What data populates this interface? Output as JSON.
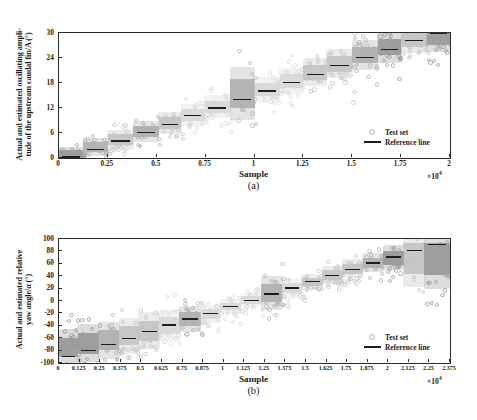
{
  "figure": {
    "panels": [
      {
        "tag": "(a)",
        "xlabel": "Sample",
        "ylabel": "Actual and estimated oscillating ampli-\ntude of the upstream caudal fin/A (°)",
        "x_exponent": "×10",
        "x_exponent_sup": "4",
        "legend": [
          {
            "label": "Test set",
            "marker": "circle"
          },
          {
            "label": "Reference line",
            "marker": "line"
          }
        ]
      },
      {
        "tag": "(b)",
        "xlabel": "Sample",
        "ylabel": "Actual and estimated relative\nyaw angle/α (°)",
        "x_exponent": "×10",
        "x_exponent_sup": "4",
        "legend": [
          {
            "label": "Test set",
            "marker": "circle"
          },
          {
            "label": "Reference line",
            "marker": "line"
          }
        ]
      }
    ]
  },
  "chart_data": [
    {
      "type": "scatter",
      "title": "",
      "subtitle": "(a)",
      "xlabel": "Sample",
      "ylabel": "Actual and estimated oscillating amplitude of the upstream caudal fin/A (°)",
      "x_tick_labels": [
        "0",
        "0.25",
        "0.5",
        "0.75",
        "1",
        "1.25",
        "1.5",
        "1.75",
        "2"
      ],
      "x_tick_values": [
        0,
        2500,
        5000,
        7500,
        10000,
        12500,
        15000,
        17500,
        20000
      ],
      "x_axis_multiplier": "×10^4",
      "y_tick_labels": [
        "0",
        "6",
        "12",
        "18",
        "24",
        "30"
      ],
      "y_tick_values": [
        0,
        6,
        12,
        18,
        24,
        30
      ],
      "xlim": [
        0,
        20000
      ],
      "ylim": [
        0,
        30
      ],
      "grid": false,
      "legend": [
        "Test set",
        "Reference line"
      ],
      "legend_position": "lower-right",
      "series": [
        {
          "name": "Reference line",
          "type": "step",
          "note": "piecewise constant actual value per sample block",
          "segments": [
            {
              "x_start": 0,
              "x_end": 1250,
              "value": 0.2
            },
            {
              "x_start": 1250,
              "x_end": 2500,
              "value": 2.1
            },
            {
              "x_start": 2500,
              "x_end": 3800,
              "value": 4.1
            },
            {
              "x_start": 3800,
              "x_end": 5100,
              "value": 6.1
            },
            {
              "x_start": 5100,
              "x_end": 6250,
              "value": 8.1
            },
            {
              "x_start": 6250,
              "x_end": 7450,
              "value": 10.2
            },
            {
              "x_start": 7450,
              "x_end": 8750,
              "value": 12.0
            },
            {
              "x_start": 8750,
              "x_end": 10000,
              "value": 14.0
            },
            {
              "x_start": 10000,
              "x_end": 11300,
              "value": 16.1
            },
            {
              "x_start": 11300,
              "x_end": 12500,
              "value": 18.1
            },
            {
              "x_start": 12500,
              "x_end": 13700,
              "value": 20.1
            },
            {
              "x_start": 13700,
              "x_end": 15000,
              "value": 22.2
            },
            {
              "x_start": 15000,
              "x_end": 16300,
              "value": 24.1
            },
            {
              "x_start": 16300,
              "x_end": 17500,
              "value": 26.1
            },
            {
              "x_start": 17500,
              "x_end": 18800,
              "value": 28.2
            },
            {
              "x_start": 18800,
              "x_end": 20000,
              "value": 30.0
            }
          ]
        },
        {
          "name": "Test set",
          "type": "scatter-cloud",
          "note": "estimated values scattered about each reference level",
          "clouds": [
            {
              "x_start": 0,
              "x_end": 1250,
              "center": 0.9,
              "spread": 1.6,
              "shade": "dark"
            },
            {
              "x_start": 1250,
              "x_end": 2500,
              "center": 2.6,
              "spread": 1.9,
              "shade": "mid"
            },
            {
              "x_start": 2500,
              "x_end": 3800,
              "center": 4.4,
              "spread": 2.1,
              "shade": "light"
            },
            {
              "x_start": 3800,
              "x_end": 5100,
              "center": 6.4,
              "spread": 2.2,
              "shade": "mid"
            },
            {
              "x_start": 5100,
              "x_end": 6250,
              "center": 8.4,
              "spread": 2.3,
              "shade": "light"
            },
            {
              "x_start": 6250,
              "x_end": 7450,
              "center": 10.4,
              "spread": 2.3,
              "shade": "verylight"
            },
            {
              "x_start": 7450,
              "x_end": 8750,
              "center": 12.3,
              "spread": 2.4,
              "shade": "verylight"
            },
            {
              "x_start": 8750,
              "x_end": 10000,
              "center": 15.5,
              "spread": 5.5,
              "shade": "mid"
            },
            {
              "x_start": 10000,
              "x_end": 11300,
              "center": 16.4,
              "spread": 2.6,
              "shade": "verylight"
            },
            {
              "x_start": 11300,
              "x_end": 12500,
              "center": 18.5,
              "spread": 2.7,
              "shade": "verylight"
            },
            {
              "x_start": 12500,
              "x_end": 13700,
              "center": 20.6,
              "spread": 2.9,
              "shade": "light"
            },
            {
              "x_start": 13700,
              "x_end": 15000,
              "center": 22.6,
              "spread": 3.0,
              "shade": "light"
            },
            {
              "x_start": 15000,
              "x_end": 16300,
              "center": 24.7,
              "spread": 3.1,
              "shade": "mid"
            },
            {
              "x_start": 16300,
              "x_end": 17500,
              "center": 26.6,
              "spread": 3.2,
              "shade": "dark"
            },
            {
              "x_start": 17500,
              "x_end": 18800,
              "center": 28.6,
              "spread": 3.0,
              "shade": "light"
            },
            {
              "x_start": 18800,
              "x_end": 20000,
              "center": 29.0,
              "spread": 3.0,
              "shade": "dark"
            }
          ]
        }
      ]
    },
    {
      "type": "scatter",
      "title": "",
      "subtitle": "(b)",
      "xlabel": "Sample",
      "ylabel": "Actual and estimated relative yaw angle/α (°)",
      "x_tick_labels": [
        "0",
        "0.125",
        "0.25",
        "0.375",
        "0.5",
        "0.625",
        "0.75",
        "0.875",
        "1",
        "1.125",
        "1.25",
        "1.375",
        "1.5",
        "1.625",
        "1.75",
        "1.875",
        "2",
        "2.125",
        "2.25",
        "2.375"
      ],
      "x_tick_values": [
        0,
        1250,
        2500,
        3750,
        5000,
        6250,
        7500,
        8750,
        10000,
        11250,
        12500,
        13750,
        15000,
        16250,
        17500,
        18750,
        20000,
        21250,
        22500,
        23750
      ],
      "x_axis_multiplier": "×10^4",
      "y_tick_labels": [
        "-100",
        "-80",
        "-60",
        "-40",
        "-20",
        "0",
        "20",
        "40",
        "60",
        "80",
        "100"
      ],
      "y_tick_values": [
        -100,
        -80,
        -60,
        -40,
        -20,
        0,
        20,
        40,
        60,
        80,
        100
      ],
      "xlim": [
        0,
        23750
      ],
      "ylim": [
        -100,
        100
      ],
      "grid": false,
      "legend": [
        "Test set",
        "Reference line"
      ],
      "legend_position": "lower-right",
      "series": [
        {
          "name": "Reference line",
          "type": "step",
          "segments": [
            {
              "x_start": 0,
              "x_end": 1150,
              "value": -90
            },
            {
              "x_start": 1150,
              "x_end": 2400,
              "value": -80
            },
            {
              "x_start": 2400,
              "x_end": 3650,
              "value": -70
            },
            {
              "x_start": 3650,
              "x_end": 4850,
              "value": -60
            },
            {
              "x_start": 4850,
              "x_end": 6100,
              "value": -49
            },
            {
              "x_start": 6100,
              "x_end": 7300,
              "value": -39
            },
            {
              "x_start": 7300,
              "x_end": 8600,
              "value": -29
            },
            {
              "x_start": 8600,
              "x_end": 9800,
              "value": -20
            },
            {
              "x_start": 9800,
              "x_end": 11050,
              "value": -9
            },
            {
              "x_start": 11050,
              "x_end": 12300,
              "value": 1
            },
            {
              "x_start": 12300,
              "x_end": 13550,
              "value": 11
            },
            {
              "x_start": 13550,
              "x_end": 14750,
              "value": 21
            },
            {
              "x_start": 14750,
              "x_end": 16000,
              "value": 31
            },
            {
              "x_start": 16000,
              "x_end": 17200,
              "value": 41
            },
            {
              "x_start": 17200,
              "x_end": 18450,
              "value": 51
            },
            {
              "x_start": 18450,
              "x_end": 19700,
              "value": 61
            },
            {
              "x_start": 19700,
              "x_end": 20950,
              "value": 71
            },
            {
              "x_start": 20950,
              "x_end": 22200,
              "value": 81
            },
            {
              "x_start": 22200,
              "x_end": 23750,
              "value": 91
            }
          ]
        },
        {
          "name": "Test set",
          "type": "scatter-cloud",
          "clouds": [
            {
              "x_start": 0,
              "x_end": 1150,
              "center": -75,
              "spread": 26,
              "shade": "dark"
            },
            {
              "x_start": 1150,
              "x_end": 2400,
              "center": -68,
              "spread": 27,
              "shade": "dark"
            },
            {
              "x_start": 2400,
              "x_end": 3650,
              "center": -63,
              "spread": 26,
              "shade": "mid"
            },
            {
              "x_start": 3650,
              "x_end": 4850,
              "center": -56,
              "spread": 25,
              "shade": "light"
            },
            {
              "x_start": 4850,
              "x_end": 6100,
              "center": -48,
              "spread": 26,
              "shade": "light"
            },
            {
              "x_start": 6100,
              "x_end": 7300,
              "center": -40,
              "spread": 22,
              "shade": "verylight"
            },
            {
              "x_start": 7300,
              "x_end": 8600,
              "center": -29,
              "spread": 18,
              "shade": "mid"
            },
            {
              "x_start": 8600,
              "x_end": 9800,
              "center": -21,
              "spread": 12,
              "shade": "verylight"
            },
            {
              "x_start": 9800,
              "x_end": 11050,
              "center": -9,
              "spread": 10,
              "shade": "verylight"
            },
            {
              "x_start": 11050,
              "x_end": 12300,
              "center": 2,
              "spread": 10,
              "shade": "verylight"
            },
            {
              "x_start": 12300,
              "x_end": 13550,
              "center": 13,
              "spread": 24,
              "shade": "mid"
            },
            {
              "x_start": 13550,
              "x_end": 14750,
              "center": 21,
              "spread": 12,
              "shade": "verylight"
            },
            {
              "x_start": 14750,
              "x_end": 16000,
              "center": 31,
              "spread": 11,
              "shade": "light"
            },
            {
              "x_start": 16000,
              "x_end": 17200,
              "center": 42,
              "spread": 12,
              "shade": "light"
            },
            {
              "x_start": 17200,
              "x_end": 18450,
              "center": 52,
              "spread": 13,
              "shade": "light"
            },
            {
              "x_start": 18450,
              "x_end": 19700,
              "center": 62,
              "spread": 13,
              "shade": "mid"
            },
            {
              "x_start": 19700,
              "x_end": 20950,
              "center": 70,
              "spread": 18,
              "shade": "dark"
            },
            {
              "x_start": 20950,
              "x_end": 22200,
              "center": 68,
              "spread": 40,
              "shade": "light"
            },
            {
              "x_start": 22200,
              "x_end": 23750,
              "center": 68,
              "spread": 42,
              "shade": "dark"
            }
          ]
        }
      ]
    }
  ],
  "palette": {
    "axis": "#2b2b2b",
    "refline": "#1d1d1d",
    "dark": "#9a9a9a",
    "mid": "#b0b0b0",
    "light": "#c4c4c4",
    "verylight": "#d8d8d8",
    "background": "#ffffff"
  }
}
